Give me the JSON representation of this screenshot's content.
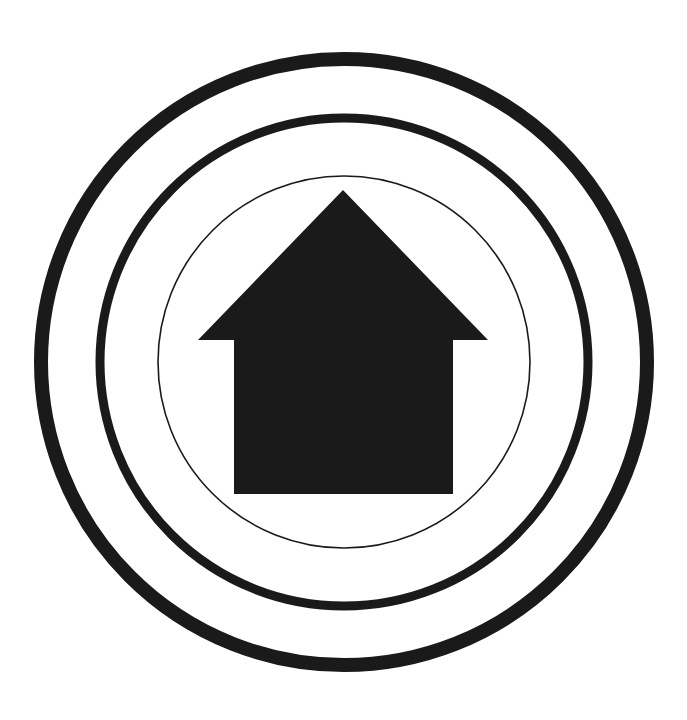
{
  "figure": {
    "description": "Home icon surrounded by three concentric rings",
    "icon": "home-icon",
    "colors": {
      "background": "#ffffff",
      "ink": "#1a1a1a"
    },
    "rings": [
      {
        "name": "outer-ring",
        "cx": 344,
        "cy": 362,
        "r": 303,
        "stroke_width": 14
      },
      {
        "name": "middle-ring",
        "cx": 344,
        "cy": 362,
        "r": 244,
        "stroke_width": 9
      },
      {
        "name": "inner-ring",
        "cx": 344,
        "cy": 362,
        "r": 186,
        "stroke_width": 1.6
      }
    ],
    "house": {
      "apex": [
        343,
        190
      ],
      "roof_left": [
        198,
        340
      ],
      "roof_right": [
        488,
        340
      ],
      "body_left": 234,
      "body_right": 453,
      "body_bottom": 494
    }
  }
}
